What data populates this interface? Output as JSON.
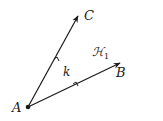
{
  "diagram": {
    "type": "angle",
    "vertex": {
      "label": "A",
      "x": 28,
      "y": 107
    },
    "rays": [
      {
        "name": "ray-AC",
        "label": "C",
        "end": {
          "x": 78,
          "y": 16
        }
      },
      {
        "name": "ray-AB",
        "label": "B",
        "end": {
          "x": 120,
          "y": 63
        }
      }
    ],
    "angle_label": "k",
    "half_plane_label": "ℋ",
    "half_plane_subscript": "1",
    "colors": {
      "stroke": "#1a1a1a",
      "background": "#ffffff"
    }
  }
}
